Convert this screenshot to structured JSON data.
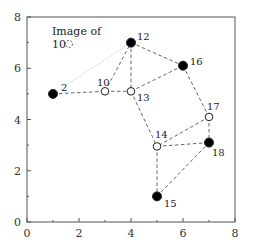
{
  "chart_data": {
    "type": "scatter",
    "title": "",
    "xlabel": "",
    "ylabel": "",
    "xlim": [
      0,
      8
    ],
    "ylim": [
      0,
      8
    ],
    "grid": false,
    "x_ticks": [
      "0",
      "2",
      "4",
      "6",
      "8"
    ],
    "y_ticks": [
      "0",
      "2",
      "4",
      "6",
      "8"
    ],
    "nodes": [
      {
        "id": "2",
        "x": 1,
        "y": 5.0,
        "filled": true
      },
      {
        "id": "10",
        "x": 3,
        "y": 5.1,
        "filled": false
      },
      {
        "id": "12",
        "x": 4,
        "y": 7.0,
        "filled": true
      },
      {
        "id": "13",
        "x": 4,
        "y": 5.1,
        "filled": false
      },
      {
        "id": "14",
        "x": 5,
        "y": 2.95,
        "filled": false
      },
      {
        "id": "15",
        "x": 5,
        "y": 1.0,
        "filled": true
      },
      {
        "id": "16",
        "x": 6,
        "y": 6.1,
        "filled": true
      },
      {
        "id": "17",
        "x": 7,
        "y": 4.1,
        "filled": false
      },
      {
        "id": "18",
        "x": 7,
        "y": 3.1,
        "filled": true
      }
    ],
    "edges_dashed": [
      [
        "2",
        "10"
      ],
      [
        "10",
        "13"
      ],
      [
        "10",
        "12"
      ],
      [
        "12",
        "13"
      ],
      [
        "12",
        "16"
      ],
      [
        "13",
        "16"
      ],
      [
        "13",
        "14"
      ],
      [
        "16",
        "17"
      ],
      [
        "17",
        "18"
      ],
      [
        "17",
        "14"
      ],
      [
        "14",
        "18"
      ],
      [
        "14",
        "15"
      ],
      [
        "15",
        "18"
      ]
    ],
    "edges_dotted": [
      [
        "2",
        "12"
      ]
    ],
    "annotation": {
      "line1": "Image of",
      "line2": "10",
      "ghost_node": {
        "x": 1.62,
        "y": 6.97
      }
    }
  }
}
